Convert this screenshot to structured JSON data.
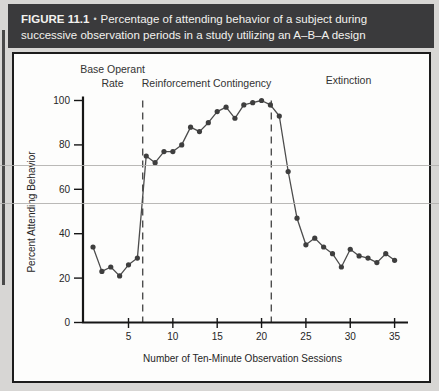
{
  "header": {
    "label": "FIGURE 11.1",
    "bullet": "•",
    "caption": "Percentage of attending behavior of a subject during successive observation periods in a study utilizing an A–B–A design",
    "bg_color": "#3a3a3c",
    "text_color": "#f3f2ef"
  },
  "chart_data": {
    "type": "line",
    "title": "",
    "xlabel": "Number of Ten-Minute Observation Sessions",
    "ylabel": "Percent Attending Behavior",
    "xlim": [
      0,
      37
    ],
    "ylim": [
      0,
      100
    ],
    "x_ticks": [
      5,
      10,
      15,
      20,
      25,
      30,
      35
    ],
    "y_ticks": [
      0,
      20,
      40,
      60,
      80,
      100
    ],
    "grid": false,
    "legend": "none",
    "line_color": "#4c4c4c",
    "marker_color": "#3e3e3e",
    "axis_color": "#161616",
    "phase_dividers_x": [
      6.6,
      21.1
    ],
    "phases": [
      {
        "lines": [
          "Base Operant",
          "Rate"
        ],
        "center_session": 3.2
      },
      {
        "lines": [
          "Reinforcement Contingency"
        ],
        "center_session": 13.8
      },
      {
        "lines": [
          "Extinction"
        ],
        "center_session": 29.8
      }
    ],
    "series": [
      {
        "name": "percent-attending-behavior",
        "x": [
          1,
          2,
          3,
          4,
          5,
          6,
          7,
          8,
          9,
          10,
          11,
          12,
          13,
          14,
          15,
          16,
          17,
          18,
          19,
          20,
          21,
          22,
          23,
          24,
          25,
          26,
          27,
          28,
          29,
          30,
          31,
          32,
          33,
          34,
          35
        ],
        "y": [
          34,
          23,
          25,
          21,
          26,
          29,
          75,
          72,
          77,
          77,
          80,
          88,
          86,
          90,
          95,
          97,
          92,
          98,
          99,
          100,
          98,
          93,
          68,
          47,
          35,
          38,
          34,
          31,
          25,
          33,
          30,
          29,
          27,
          31,
          28
        ]
      }
    ]
  }
}
